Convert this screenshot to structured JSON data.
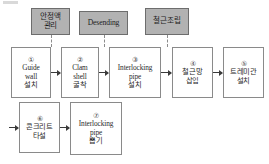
{
  "diagram": {
    "colors": {
      "gray_box_fill": "#b2b2b2",
      "gray_box_border": "#6d6d6d",
      "process_box_fill": "#ffffff",
      "process_box_border": "#8a8a8a",
      "arrow": "#3a3a3a",
      "dashed_connector": "#8c8c8c",
      "background": "#ffffff"
    },
    "control_boxes": [
      {
        "id": "stabilizer-management",
        "lines": [
          "안정액",
          "관리"
        ]
      },
      {
        "id": "desending",
        "lines": [
          "Desending"
        ]
      },
      {
        "id": "rebar-assembly",
        "lines": [
          "철근조립"
        ]
      }
    ],
    "process_boxes": [
      {
        "id": "guide-wall",
        "number": "①",
        "lines": [
          "Guide",
          "wall",
          "설치"
        ]
      },
      {
        "id": "clam-shell",
        "number": "②",
        "lines": [
          "Clam",
          "shell",
          "굴착"
        ]
      },
      {
        "id": "interlocking-pipe-install",
        "number": "③",
        "lines": [
          "Interlocking",
          "pipe",
          "설치"
        ]
      },
      {
        "id": "rebar-cage-insert",
        "number": "④",
        "lines": [
          "철근망",
          "삽입"
        ]
      },
      {
        "id": "tremie-pipe-install",
        "number": "⑤",
        "lines": [
          "트레미관",
          "설치"
        ]
      },
      {
        "id": "concrete-placement",
        "number": "⑥",
        "lines": [
          "콘크리트",
          "타설"
        ]
      },
      {
        "id": "interlocking-pipe-extract",
        "number": "⑦",
        "lines": [
          "Interlocking",
          "pipe",
          "뽑기"
        ]
      }
    ]
  }
}
